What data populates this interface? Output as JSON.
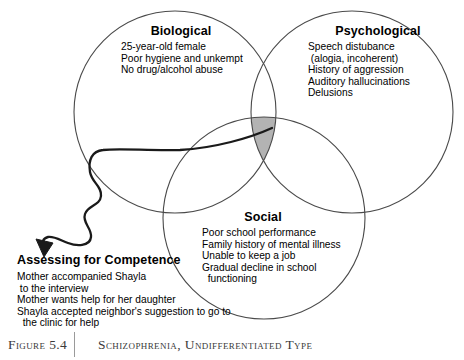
{
  "figure": {
    "caption_label": "Figure 5.4",
    "caption_title": "Schizophrenia, Undifferentiated Type",
    "background_color": "#ffffff",
    "circle_stroke_color": "#4a4a4a",
    "overlap_fill_color": "#b3b3b3",
    "arrow_color": "#1a1a1a"
  },
  "domains": {
    "biological": {
      "title": "Biological",
      "items": [
        "25-year-old female",
        "Poor hygiene and unkempt",
        "No drug/alcohol abuse"
      ]
    },
    "psychological": {
      "title": "Psychological",
      "items": [
        "Speech distubance",
        " (alogia, incoherent)",
        "History of aggression",
        "Auditory hallucinations",
        "Delusions"
      ]
    },
    "social": {
      "title": "Social",
      "items": [
        "Poor school performance",
        "Family history of mental illness",
        "Unable to keep a job",
        "Gradual decline in school",
        "  functioning"
      ]
    }
  },
  "assessing": {
    "title": "Assessing for Competence",
    "items": [
      "Mother accompanied Shayla",
      " to the interview",
      "Mother wants help for her daughter",
      "Shayla accepted neighbor's suggestion to go to",
      "  the clinic for help"
    ]
  }
}
